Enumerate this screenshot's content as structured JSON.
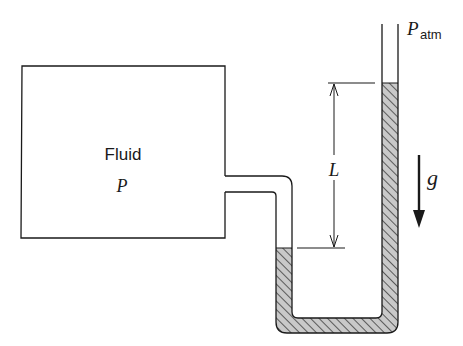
{
  "diagram": {
    "colors": {
      "stroke": "#1a1a1a",
      "liquid_fill": "#c9c9c9",
      "hatch": "#2a2a2a",
      "background": "#ffffff"
    },
    "container": {
      "label": "Fluid",
      "pressure_symbol": "P"
    },
    "right_tube": {
      "pressure_symbol": "P",
      "pressure_subscript": "atm"
    },
    "dimension": {
      "label": "L"
    },
    "gravity": {
      "label": "g"
    }
  }
}
